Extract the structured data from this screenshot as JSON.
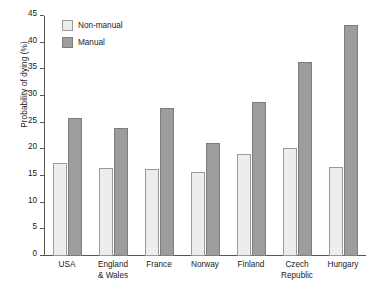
{
  "chart_data": {
    "type": "bar",
    "title": "",
    "subtitle": "",
    "xlabel": "",
    "ylabel": "Probability of dying (%)",
    "ylim": [
      0,
      45
    ],
    "yticks": [
      0,
      5,
      10,
      15,
      20,
      25,
      30,
      35,
      40,
      45
    ],
    "ytick_labels": [
      "0",
      "5",
      "10",
      "15",
      "20",
      "25",
      "30",
      "35",
      "40",
      "45"
    ],
    "grid": false,
    "legend_position": "top-left",
    "categories": [
      "USA",
      "England & Wales",
      "France",
      "Norway",
      "Finland",
      "Czech Republic",
      "Hungary"
    ],
    "category_lines": [
      [
        "USA"
      ],
      [
        "England",
        "& Wales"
      ],
      [
        "France"
      ],
      [
        "Norway"
      ],
      [
        "Finland"
      ],
      [
        "Czech",
        "Republic"
      ],
      [
        "Hungary"
      ]
    ],
    "series": [
      {
        "name": "Non-manual",
        "color": "#ededed",
        "border_color": "#9a9a9a",
        "values": [
          17.5,
          16.5,
          16.4,
          15.7,
          19.1,
          20.3,
          16.7
        ]
      },
      {
        "name": "Manual",
        "color": "#9d9d9d",
        "border_color": "#7d7d7d",
        "values": [
          25.8,
          24.0,
          27.8,
          21.1,
          28.9,
          36.3,
          43.4
        ]
      }
    ]
  },
  "legend": {
    "items": [
      {
        "label": "Non-manual",
        "swatch": "nonmanual"
      },
      {
        "label": "Manual",
        "swatch": "manual"
      }
    ]
  }
}
